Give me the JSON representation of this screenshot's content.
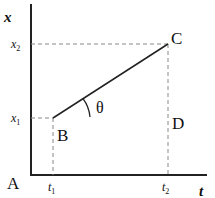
{
  "diagram": {
    "axes": {
      "y_label": "x",
      "x_label": "t",
      "origin_label": "A"
    },
    "ticks": {
      "y": [
        {
          "label": "x",
          "sub": "2"
        },
        {
          "label": "x",
          "sub": "1"
        }
      ],
      "x": [
        {
          "label": "t",
          "sub": "1"
        },
        {
          "label": "t",
          "sub": "2"
        }
      ]
    },
    "points": {
      "B": "B",
      "C": "C",
      "D": "D"
    },
    "angle_label": "θ",
    "colors": {
      "line": "#222222",
      "dashed": "#888888"
    }
  }
}
